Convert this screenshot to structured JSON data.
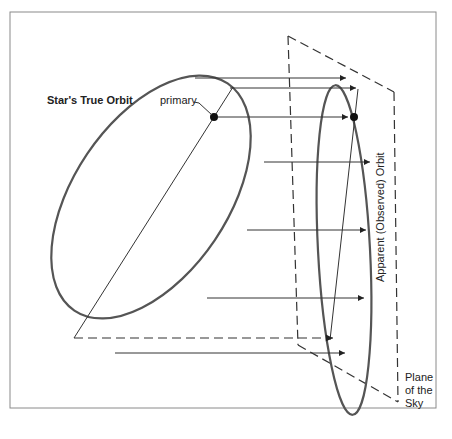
{
  "figure": {
    "labels": {
      "true_orbit": "Star's True Orbit",
      "primary": "primary",
      "apparent_orbit": "Apparent (Observed) Orbit",
      "plane_line1": "Plane",
      "plane_line2": "of the",
      "plane_line3": "Sky"
    },
    "colors": {
      "background": "#ffffff",
      "frame": "#8a8a8a",
      "orbit_stroke": "#555555",
      "line": "#333333"
    }
  }
}
